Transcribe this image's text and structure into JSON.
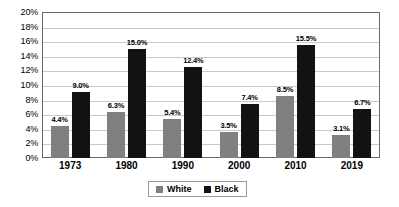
{
  "chart_data": {
    "type": "bar",
    "title": "",
    "subtitle": "",
    "xlabel": "",
    "ylabel": "",
    "categories": [
      "1973",
      "1980",
      "1990",
      "2000",
      "2010",
      "2019"
    ],
    "series": [
      {
        "name": "White",
        "color": "#808080",
        "values": [
          4.4,
          6.3,
          5.4,
          3.5,
          8.5,
          3.1
        ],
        "labels": [
          "4.4%",
          "6.3%",
          "5.4%",
          "3.5%",
          "8.5%",
          "3.1%"
        ]
      },
      {
        "name": "Black",
        "color": "#121212",
        "values": [
          9.0,
          15.0,
          12.4,
          7.4,
          15.5,
          6.7
        ],
        "labels": [
          "9.0%",
          "15.0%",
          "12.4%",
          "7.4%",
          "15.5%",
          "6.7%"
        ]
      }
    ],
    "ylim": [
      0,
      20
    ],
    "ytick_step": 2,
    "ytick_labels": [
      "0%",
      "2%",
      "4%",
      "6%",
      "8%",
      "10%",
      "12%",
      "14%",
      "16%",
      "18%",
      "20%"
    ],
    "grid": true,
    "legend_position": "bottom-center",
    "legend_entries": [
      "White",
      "Black"
    ]
  }
}
